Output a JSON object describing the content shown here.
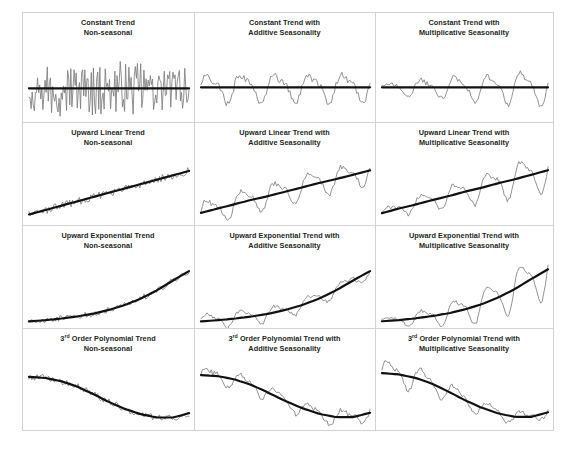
{
  "figure": {
    "name": "time-series-trend-seasonality-grid",
    "background_color": "#ffffff",
    "panel_border_color": "#d3d3d3",
    "series_color": "#7d7d7d",
    "trend_color": "#111111",
    "rows": 4,
    "columns": 3
  },
  "panels": [
    {
      "id": "constant-nonseasonal",
      "title_line1": "Constant Trend",
      "title_line2": "Non-seasonal",
      "trend": "constant",
      "seasonality": "none"
    },
    {
      "id": "constant-additive",
      "title_line1": "Constant Trend with",
      "title_line2": "Additive Seasonality",
      "trend": "constant",
      "seasonality": "additive"
    },
    {
      "id": "constant-multiplicative",
      "title_line1": "Constant Trend with",
      "title_line2": "Multiplicative Seasonality",
      "trend": "constant",
      "seasonality": "multiplicative"
    },
    {
      "id": "linear-nonseasonal",
      "title_line1": "Upward Linear Trend",
      "title_line2": "Non-seasonal",
      "trend": "linear",
      "seasonality": "none"
    },
    {
      "id": "linear-additive",
      "title_line1": "Upward Linear Trend with",
      "title_line2": "Additive Seasonality",
      "trend": "linear",
      "seasonality": "additive"
    },
    {
      "id": "linear-multiplicative",
      "title_line1": "Upward Linear Trend with",
      "title_line2": "Multiplicative Seasonality",
      "trend": "linear",
      "seasonality": "multiplicative"
    },
    {
      "id": "exponential-nonseasonal",
      "title_line1": "Upward Exponential Trend",
      "title_line2": "Non-seasonal",
      "trend": "exponential",
      "seasonality": "none"
    },
    {
      "id": "exponential-additive",
      "title_line1": "Upward Exponential Trend with",
      "title_line2": "Additive Seasonality",
      "trend": "exponential",
      "seasonality": "additive"
    },
    {
      "id": "exponential-multiplicative",
      "title_line1": "Upward Exponential Trend with",
      "title_line2": "Multiplicative Seasonality",
      "trend": "exponential",
      "seasonality": "multiplicative"
    },
    {
      "id": "polynomial-nonseasonal",
      "title_line1_prefix": "3",
      "title_line1_sup": "rd",
      "title_line1_rest": " Order Polynomial Trend",
      "title_line2": "Non-seasonal",
      "trend": "cubic",
      "seasonality": "none"
    },
    {
      "id": "polynomial-additive",
      "title_line1_prefix": "3",
      "title_line1_sup": "rd",
      "title_line1_rest": " Order Polynomial Trend with",
      "title_line2": "Additive Seasonality",
      "trend": "cubic",
      "seasonality": "additive"
    },
    {
      "id": "polynomial-multiplicative",
      "title_line1_prefix": "3",
      "title_line1_sup": "rd",
      "title_line1_rest": " Order Polynomial Trend with",
      "title_line2": "Multiplicative Seasonality",
      "trend": "cubic",
      "seasonality": "multiplicative"
    }
  ],
  "chart_data": {
    "type": "line",
    "xlabel": "",
    "ylabel": "",
    "grid": false,
    "legend": "none",
    "axis_ticks": "none",
    "panel_count": 12,
    "layout": "4 rows (trend type) x 3 columns (seasonality type)",
    "row_labels": [
      "Constant Trend",
      "Upward Linear Trend",
      "Upward Exponential Trend",
      "3rd Order Polynomial Trend"
    ],
    "column_labels": [
      "Non-seasonal",
      "Additive Seasonality",
      "Multiplicative Seasonality"
    ],
    "series": [
      {
        "name": "constant-nonseasonal-noise",
        "description": "High frequency random noise about a flat level",
        "trend_values": [
          50,
          50,
          50,
          50,
          50,
          50,
          50,
          50,
          50,
          50,
          50
        ],
        "noise_amplitude": 36,
        "seasonal_amplitude": 0
      },
      {
        "name": "constant-additive-seasonal",
        "description": "Flat level with constant amplitude seasonal waves",
        "trend_values": [
          50,
          50,
          50,
          50,
          50,
          50,
          50,
          50,
          50,
          50,
          50
        ],
        "noise_amplitude": 6,
        "seasonal_amplitude": 26,
        "seasonal_cycles": 5
      },
      {
        "name": "constant-multiplicative-seasonal",
        "description": "Flat level with growing amplitude seasonal waves",
        "trend_values": [
          50,
          50,
          50,
          50,
          50,
          50,
          50,
          50,
          50,
          50,
          50
        ],
        "noise_amplitude": 5,
        "seasonal_amplitude_start": 9,
        "seasonal_amplitude_end": 34,
        "seasonal_cycles": 5
      },
      {
        "name": "linear-nonseasonal-noise",
        "description": "Rising straight-line trend with small random noise",
        "trend_values": [
          12,
          20,
          28,
          36,
          44,
          52,
          60,
          68,
          76,
          84,
          92
        ],
        "noise_amplitude": 8,
        "seasonal_amplitude": 0
      },
      {
        "name": "linear-additive-seasonal",
        "description": "Rising straight-line trend with constant amplitude seasonal waves",
        "trend_values": [
          15,
          23,
          31,
          39,
          46,
          54,
          62,
          70,
          77,
          85,
          93
        ],
        "noise_amplitude": 5,
        "seasonal_amplitude": 24,
        "seasonal_cycles": 5
      },
      {
        "name": "linear-multiplicative-seasonal",
        "description": "Rising straight-line trend with growing amplitude seasonal waves",
        "trend_values": [
          14,
          22,
          29,
          37,
          44,
          52,
          59,
          67,
          74,
          82,
          90
        ],
        "noise_amplitude": 4,
        "seasonal_amplitude_start": 8,
        "seasonal_amplitude_end": 38,
        "seasonal_cycles": 5
      },
      {
        "name": "exponential-nonseasonal-noise",
        "description": "Exponentially accelerating trend with small random noise",
        "trend_values": [
          5,
          7,
          10,
          14,
          19,
          26,
          35,
          47,
          62,
          80,
          97
        ],
        "noise_amplitude": 6,
        "seasonal_amplitude": 0
      },
      {
        "name": "exponential-additive-seasonal",
        "description": "Exponentially accelerating trend with constant amplitude seasonal waves",
        "trend_values": [
          5,
          7,
          10,
          14,
          19,
          26,
          35,
          47,
          62,
          80,
          97
        ],
        "noise_amplitude": 4,
        "seasonal_amplitude": 14,
        "seasonal_cycles": 5
      },
      {
        "name": "exponential-multiplicative-seasonal",
        "description": "Exponentially accelerating trend with rapidly growing amplitude seasonal waves",
        "trend_values": [
          5,
          7,
          10,
          14,
          19,
          26,
          35,
          47,
          62,
          80,
          97
        ],
        "noise_amplitude": 3,
        "seasonal_amplitude_start": 5,
        "seasonal_amplitude_end": 48,
        "seasonal_cycles": 5
      },
      {
        "name": "polynomial-nonseasonal-noise",
        "description": "S-shaped cubic trend falling then rising, with small random noise",
        "trend_values": [
          92,
          90,
          84,
          74,
          60,
          45,
          32,
          22,
          16,
          16,
          24
        ],
        "noise_amplitude": 7,
        "seasonal_amplitude": 0
      },
      {
        "name": "polynomial-additive-seasonal",
        "description": "S-shaped cubic trend with constant amplitude seasonal waves",
        "trend_values": [
          92,
          90,
          84,
          74,
          60,
          45,
          32,
          22,
          16,
          16,
          24
        ],
        "noise_amplitude": 5,
        "seasonal_amplitude": 14,
        "seasonal_cycles": 5
      },
      {
        "name": "polynomial-multiplicative-seasonal",
        "description": "S-shaped cubic trend with amplitude shrinking as level falls",
        "trend_values": [
          92,
          90,
          84,
          74,
          60,
          45,
          32,
          22,
          16,
          16,
          24
        ],
        "noise_amplitude": 4,
        "seasonal_amplitude_start": 26,
        "seasonal_amplitude_end": 7,
        "seasonal_cycles": 5
      }
    ]
  }
}
